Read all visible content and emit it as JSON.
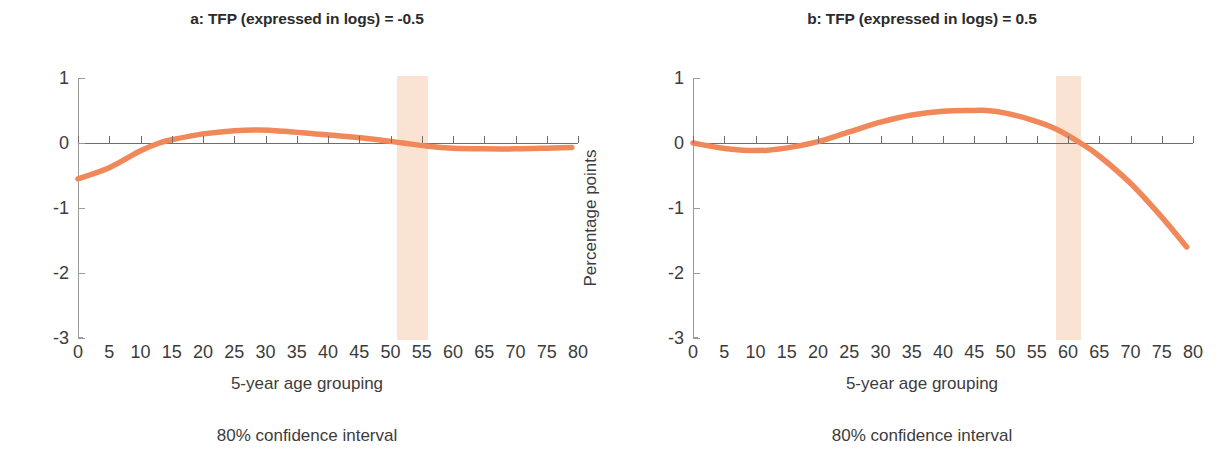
{
  "figure": {
    "width": 1229,
    "height": 464,
    "line_color": "#f0885a",
    "band_color": "#fae3d2",
    "axis_color": "#9b9b9b"
  },
  "panels": [
    {
      "id": "a",
      "title": "a: TFP  (expressed in logs) = -0.5",
      "xlabel": "5-year age grouping",
      "ylabel": "Percentage points",
      "footnote": "80% confidence interval"
    },
    {
      "id": "b",
      "title": "b: TFP  (expressed in logs) = 0.5",
      "xlabel": "5-year age grouping",
      "ylabel": "Percentage points",
      "footnote": "80% confidence interval"
    }
  ],
  "chart_data": [
    {
      "type": "line",
      "title": "a: TFP  (expressed in logs) = -0.5",
      "xlabel": "5-year age grouping",
      "ylabel": "Percentage points",
      "xlim": [
        0,
        80
      ],
      "ylim": [
        -3,
        1
      ],
      "xticks": [
        0,
        5,
        10,
        15,
        20,
        25,
        30,
        35,
        40,
        45,
        50,
        55,
        60,
        65,
        70,
        75,
        80
      ],
      "yticks": [
        1,
        0,
        -1,
        -2,
        -3
      ],
      "grid": false,
      "legend": "",
      "annotation": "80% confidence interval",
      "confidence_band": {
        "label": "80% confidence interval",
        "x_start": 51,
        "x_end": 56
      },
      "series": [
        {
          "name": "TFP = -0.5",
          "color": "#f0885a",
          "x": [
            0,
            5,
            10,
            13,
            15,
            20,
            25,
            29,
            33,
            38,
            43,
            48,
            52,
            56,
            60,
            65,
            70,
            75,
            79
          ],
          "values": [
            -0.55,
            -0.38,
            -0.12,
            0.0,
            0.05,
            0.14,
            0.19,
            0.2,
            0.18,
            0.14,
            0.1,
            0.05,
            0.0,
            -0.05,
            -0.08,
            -0.09,
            -0.09,
            -0.08,
            -0.07
          ]
        }
      ]
    },
    {
      "type": "line",
      "title": "b: TFP  (expressed in logs) = 0.5",
      "xlabel": "5-year age grouping",
      "ylabel": "Percentage points",
      "xlim": [
        0,
        80
      ],
      "ylim": [
        -3,
        1
      ],
      "xticks": [
        0,
        5,
        10,
        15,
        20,
        25,
        30,
        35,
        40,
        45,
        50,
        55,
        60,
        65,
        70,
        75,
        80
      ],
      "yticks": [
        1,
        0,
        -1,
        -2,
        -3
      ],
      "grid": false,
      "legend": "",
      "annotation": "80% confidence interval",
      "confidence_band": {
        "label": "80% confidence interval",
        "x_start": 58,
        "x_end": 62
      },
      "series": [
        {
          "name": "TFP = 0.5",
          "color": "#f0885a",
          "x": [
            0,
            4,
            8,
            12,
            16,
            20,
            25,
            30,
            35,
            40,
            45,
            47,
            50,
            54,
            58,
            62,
            65,
            70,
            75,
            79
          ],
          "values": [
            0.0,
            -0.07,
            -0.11,
            -0.11,
            -0.06,
            0.02,
            0.17,
            0.32,
            0.43,
            0.49,
            0.5,
            0.5,
            0.46,
            0.36,
            0.22,
            0.0,
            -0.2,
            -0.62,
            -1.14,
            -1.6
          ]
        }
      ]
    }
  ]
}
